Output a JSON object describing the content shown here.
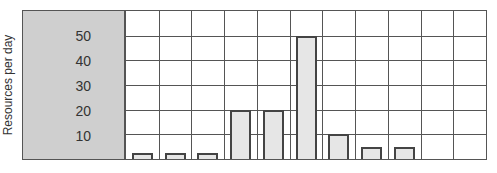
{
  "chart_data": {
    "type": "bar",
    "title": "",
    "xlabel": "",
    "ylabel": "Resources per day",
    "categories": [
      "1",
      "2",
      "3",
      "4",
      "5",
      "6",
      "7",
      "8",
      "9",
      "10",
      "11"
    ],
    "values": [
      2,
      2,
      2,
      20,
      20,
      50,
      10,
      5,
      5,
      0,
      0
    ],
    "yticks": [
      "10",
      "20",
      "30",
      "40",
      "50"
    ],
    "ylim": [
      0,
      60
    ],
    "grid": true,
    "legend": null,
    "colors": {
      "bar_fill": "#e6e6e6",
      "bar_border": "#444444",
      "panel": "#cfcfcf",
      "grid": "#555555"
    }
  }
}
